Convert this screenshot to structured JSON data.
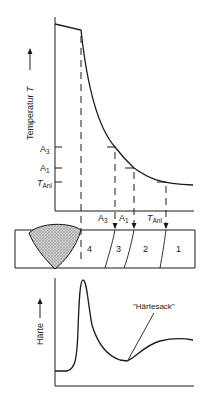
{
  "temperature_chart": {
    "y_axis_label": "Temperatur",
    "y_axis_symbol": "T",
    "levels": {
      "A3": {
        "main": "A",
        "sub": "3"
      },
      "A1": {
        "main": "A",
        "sub": "1"
      },
      "TAnl": {
        "main": "T",
        "sub": "Anl"
      }
    }
  },
  "cross_section": {
    "arrow_labels": [
      {
        "main": "A",
        "sub": "3"
      },
      {
        "main": "A",
        "sub": "1"
      },
      {
        "main": "T",
        "sub": "Anl"
      }
    ],
    "zones": [
      "4",
      "3",
      "2",
      "1"
    ]
  },
  "hardness_chart": {
    "y_axis_label": "Härte",
    "annotation": "\"Härtesack\""
  },
  "colors": {
    "line": "#1a1a1a",
    "weld_fill": "#b8b8b8"
  }
}
